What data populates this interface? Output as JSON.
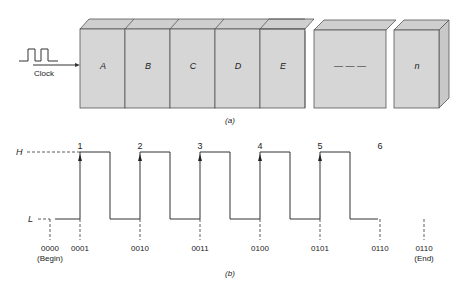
{
  "part_a": {
    "clock_label": "Clock",
    "stages": [
      "A",
      "B",
      "C",
      "D",
      "E",
      "— — —",
      "n"
    ],
    "caption": "(a)"
  },
  "part_b": {
    "level_high": "H",
    "level_low": "L",
    "pulse_numbers": [
      "1",
      "2",
      "3",
      "4",
      "5",
      "6"
    ],
    "states": [
      "0000",
      "0001",
      "0010",
      "0011",
      "0100",
      "0101",
      "0110",
      "0110"
    ],
    "begin_label": "(Begin)",
    "end_label": "(End)",
    "caption": "(b)"
  },
  "colors": {
    "box_fill": "#d6d6d6",
    "box_top": "#cfcfcf",
    "line": "#333333"
  }
}
